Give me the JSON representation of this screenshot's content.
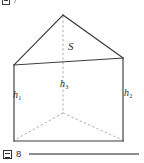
{
  "page": {
    "background_color": "#ffffff",
    "width": 144,
    "height": 163
  },
  "caption_top": {
    "icon": "zu-kanji-box-icon",
    "text": "図 7",
    "number": "7",
    "clipped": true
  },
  "caption_bottom": {
    "icon": "zu-kanji-box-icon",
    "text": "図 8",
    "number": "8",
    "rule_color": "#8c8c8c"
  },
  "figure": {
    "solid_stroke_color": "#3b3b3b",
    "hidden_stroke_color": "#9a9a9a",
    "labels": {
      "area": "S",
      "height_left": "h",
      "height_left_sub": "1",
      "height_right": "h",
      "height_right_sub": "2",
      "height_center": "h",
      "height_center_sub": "3"
    },
    "vertices": {
      "apex": [
        63,
        15
      ],
      "roof_left": [
        14,
        65
      ],
      "roof_right": [
        123,
        58
      ],
      "base_left": [
        14,
        141
      ],
      "base_right": [
        123,
        141
      ],
      "back_center_bottom": [
        63,
        113
      ]
    }
  }
}
